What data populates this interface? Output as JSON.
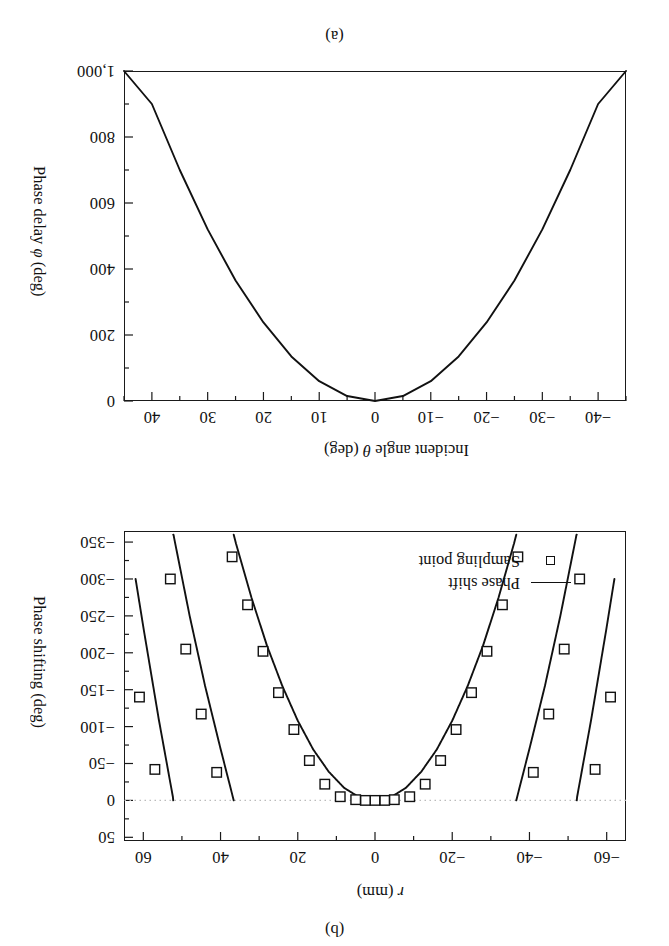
{
  "figure": {
    "panels": [
      {
        "caption": "(b)",
        "position": "top"
      },
      {
        "caption": "(a)",
        "position": "bottom"
      }
    ]
  },
  "panel_a": {
    "caption": "(a)",
    "xlabel_pre": "Incident angle ",
    "xlabel_sym": "θ",
    "xlabel_post": " (deg)",
    "ylabel_pre": "Phase delay ",
    "ylabel_sym": "φ",
    "ylabel_post": " (deg)",
    "xticks": [
      "−40",
      "−30",
      "−20",
      "−10",
      "0",
      "10",
      "20",
      "30",
      "40"
    ],
    "yticks": [
      "0",
      "200",
      "400",
      "600",
      "800",
      "1,000"
    ]
  },
  "panel_b": {
    "caption": "(b)",
    "xlabel_sym": "r",
    "xlabel_post": " (mm)",
    "ylabel": "Phase shifting (deg)",
    "xticks": [
      "−60",
      "−40",
      "−20",
      "0",
      "20",
      "40",
      "60"
    ],
    "yticks": [
      "50",
      "0",
      "−50",
      "−100",
      "−150",
      "−200",
      "−250",
      "−300",
      "−350"
    ],
    "legend": [
      {
        "key": "line",
        "label": "Phase shift"
      },
      {
        "key": "square",
        "label": "Sampling point"
      }
    ]
  },
  "colors": {
    "ink": "#1a1a1a",
    "curve": "#111111",
    "zero_line": "#bbbbbb",
    "background": "#ffffff"
  },
  "chart_data": [
    {
      "id": "panel_a",
      "type": "line",
      "title": "(a)",
      "xlabel": "Incident angle θ (deg)",
      "ylabel": "Phase delay φ (deg)",
      "xlim": [
        -45,
        45
      ],
      "ylim": [
        0,
        1000
      ],
      "y_inverted": true,
      "grid": false,
      "legend": null,
      "xticks": [
        -40,
        -30,
        -20,
        -10,
        0,
        10,
        20,
        30,
        40
      ],
      "yticks": [
        0,
        200,
        400,
        600,
        800,
        1000
      ],
      "x_minor_step": 5,
      "y_minor_step": 100,
      "series": [
        {
          "name": "Phase delay",
          "x": [
            -45,
            -40,
            -35,
            -30,
            -25,
            -20,
            -15,
            -10,
            -5,
            0,
            5,
            10,
            15,
            20,
            25,
            30,
            35,
            40,
            45
          ],
          "y": [
            1000,
            900,
            700,
            520,
            365,
            238,
            135,
            60,
            15,
            0,
            15,
            60,
            135,
            238,
            365,
            520,
            700,
            900,
            1000
          ]
        }
      ]
    },
    {
      "id": "panel_b",
      "type": "line",
      "title": "(b)",
      "xlabel": "r (mm)",
      "ylabel": "Phase shifting (deg)",
      "xlim": [
        -65,
        65
      ],
      "ylim": [
        -365,
        55
      ],
      "y_inverted": false,
      "grid": false,
      "zero_reference_line": 0,
      "legend_position": "bottom-left",
      "xticks": [
        -60,
        -40,
        -20,
        0,
        20,
        40,
        60
      ],
      "yticks": [
        50,
        0,
        -50,
        -100,
        -150,
        -200,
        -250,
        -300,
        -350
      ],
      "x_minor_step": 10,
      "y_minor_step": 25,
      "series": [
        {
          "name": "Phase shift",
          "comment": "continuous phase wrapped into (-360, 0]; sawtooth branches",
          "x_continuous": [
            -62,
            -60,
            -56,
            -52,
            -48,
            -44,
            -40,
            -36,
            -32,
            -28,
            -24,
            -20,
            -16,
            -12,
            -8,
            -4,
            0,
            4,
            8,
            12,
            16,
            20,
            24,
            28,
            32,
            36,
            40,
            44,
            48,
            52,
            56,
            60,
            62
          ],
          "y_unwrapped": [
            -1020,
            -955,
            -830,
            -715,
            -610,
            -515,
            -430,
            -348,
            -275,
            -210,
            -155,
            -108,
            -69,
            -39,
            -17,
            -4,
            0,
            -4,
            -17,
            -39,
            -69,
            -108,
            -155,
            -210,
            -275,
            -348,
            -430,
            -515,
            -610,
            -715,
            -830,
            -955,
            -1020
          ]
        },
        {
          "name": "Sampling point",
          "marker": "open-square",
          "x": [
            -61,
            -57,
            -53,
            -49,
            -45,
            -41,
            -37,
            -33,
            -29,
            -25,
            -21,
            -17,
            -13,
            -9,
            -5,
            -2.5,
            0,
            2.5,
            5,
            9,
            13,
            17,
            21,
            25,
            29,
            33,
            37,
            41,
            45,
            49,
            53,
            57,
            61
          ],
          "y_wrapped": [
            -140,
            -42,
            -300,
            -205,
            -117,
            -38,
            -330,
            -265,
            -202,
            -146,
            -96,
            -54,
            -22,
            -5,
            -1,
            0,
            0,
            0,
            -1,
            -5,
            -22,
            -54,
            -96,
            -146,
            -202,
            -265,
            -330,
            -38,
            -117,
            -205,
            -300,
            -42,
            -140
          ]
        }
      ]
    }
  ]
}
